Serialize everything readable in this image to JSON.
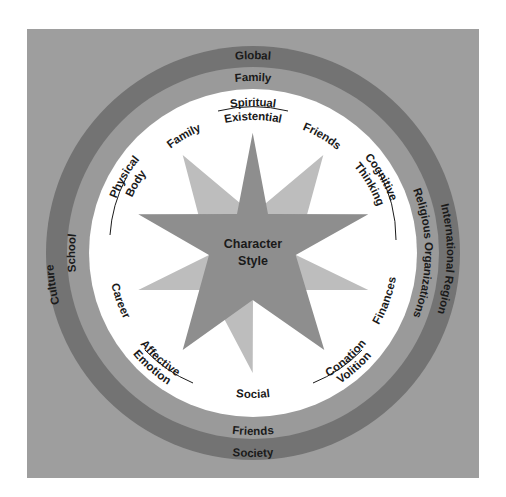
{
  "colors": {
    "page_background": "#ffffff",
    "square_background": "#9e9e9e",
    "outer_ring": "#737373",
    "middle_ring": "#9a9a9a",
    "inner_circle": "#ffffff",
    "dark_star": "#8e8e8e",
    "light_star": "#bdbdbd",
    "text": "#1a1a1a"
  },
  "center": {
    "line1": "Character",
    "line2": "Style"
  },
  "outer_ring": {
    "top": "Global",
    "left": "Culture",
    "right": "International Region",
    "bottom": "Society"
  },
  "middle_ring": {
    "top": "Family",
    "left": "School",
    "right": "Religious Organizations",
    "bottom": "Friends"
  },
  "inner_circle": {
    "dimensions": [
      {
        "top": "Spiritual",
        "bottom": "Existential",
        "position": "top"
      },
      {
        "top": "Cognitive",
        "bottom": "Thinking",
        "position": "right"
      },
      {
        "top": "Conation",
        "bottom": "Volition",
        "position": "bottom-right"
      },
      {
        "top": "Affective",
        "bottom": "Emotion",
        "position": "bottom-left"
      },
      {
        "top": "Physical",
        "bottom": "Body",
        "position": "left"
      }
    ],
    "contexts": [
      {
        "label": "Family",
        "position": "upper-left"
      },
      {
        "label": "Friends",
        "position": "upper-right"
      },
      {
        "label": "Finances",
        "position": "lower-right"
      },
      {
        "label": "Social",
        "position": "bottom"
      },
      {
        "label": "Career",
        "position": "lower-left"
      }
    ]
  }
}
